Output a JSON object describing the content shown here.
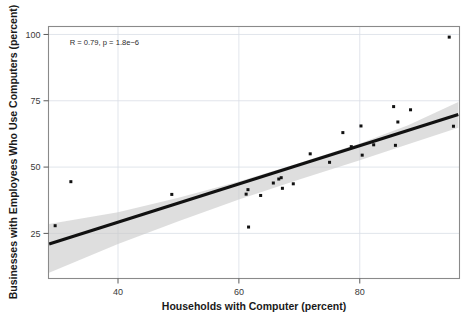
{
  "chart_data": {
    "type": "scatter",
    "title": "",
    "subtitle": "",
    "xlabel": "Households with Computer (percent)",
    "ylabel": "Businesses with Employees Who Use Computers (percent)",
    "xlim": [
      28.5,
      96.5
    ],
    "ylim": [
      8,
      103
    ],
    "xticks": [
      40,
      60,
      80
    ],
    "xtick_labels": [
      "40",
      "60",
      "80"
    ],
    "yticks": [
      25,
      50,
      75,
      100
    ],
    "ytick_labels": [
      "25",
      "50",
      "75",
      "100"
    ],
    "grid": true,
    "legend": "none",
    "annotations": [
      {
        "name": "correlation-annotation",
        "text": "R = 0.79, p = 1.8e−6",
        "x": 32,
        "y": 96
      }
    ],
    "series": [
      {
        "name": "states",
        "marker": "square",
        "color": "#111111",
        "points": [
          {
            "x": 29.6,
            "y": 27.9
          },
          {
            "x": 32.2,
            "y": 44.5
          },
          {
            "x": 48.9,
            "y": 39.7
          },
          {
            "x": 61.2,
            "y": 39.8
          },
          {
            "x": 61.5,
            "y": 41.5
          },
          {
            "x": 61.6,
            "y": 27.4
          },
          {
            "x": 63.6,
            "y": 39.3
          },
          {
            "x": 65.7,
            "y": 44.0
          },
          {
            "x": 66.6,
            "y": 45.5
          },
          {
            "x": 67.0,
            "y": 46.0
          },
          {
            "x": 67.2,
            "y": 42.0
          },
          {
            "x": 69.0,
            "y": 43.7
          },
          {
            "x": 71.8,
            "y": 55.0
          },
          {
            "x": 75.0,
            "y": 51.8
          },
          {
            "x": 77.2,
            "y": 63.0
          },
          {
            "x": 78.6,
            "y": 57.7
          },
          {
            "x": 80.2,
            "y": 65.5
          },
          {
            "x": 80.4,
            "y": 54.5
          },
          {
            "x": 82.3,
            "y": 58.4
          },
          {
            "x": 85.6,
            "y": 72.8
          },
          {
            "x": 85.9,
            "y": 58.2
          },
          {
            "x": 86.3,
            "y": 67.0
          },
          {
            "x": 88.4,
            "y": 71.6
          },
          {
            "x": 94.8,
            "y": 99.0
          },
          {
            "x": 95.5,
            "y": 65.4
          }
        ]
      }
    ],
    "fit_line": {
      "name": "linear-regression-fit",
      "color": "#111111",
      "x_start": 28.6,
      "y_start": 21.0,
      "x_end": 96.3,
      "y_end": 69.8
    },
    "confidence_band": {
      "name": "confidence-interval-ribbon",
      "color": "#c9c9c9",
      "upper": [
        {
          "x": 28.6,
          "y": 28.5
        },
        {
          "x": 40.0,
          "y": 33.0
        },
        {
          "x": 50.0,
          "y": 38.4
        },
        {
          "x": 60.0,
          "y": 44.6
        },
        {
          "x": 70.0,
          "y": 51.5
        },
        {
          "x": 80.0,
          "y": 58.9
        },
        {
          "x": 88.0,
          "y": 65.8
        },
        {
          "x": 96.3,
          "y": 74.5
        }
      ],
      "lower": [
        {
          "x": 96.3,
          "y": 64.8
        },
        {
          "x": 88.0,
          "y": 58.6
        },
        {
          "x": 80.0,
          "y": 52.6
        },
        {
          "x": 70.0,
          "y": 45.3
        },
        {
          "x": 60.0,
          "y": 37.8
        },
        {
          "x": 50.0,
          "y": 29.6
        },
        {
          "x": 40.0,
          "y": 21.0
        },
        {
          "x": 28.6,
          "y": 10.2
        }
      ]
    }
  },
  "colors": {
    "point": "#111111",
    "line": "#111111",
    "ribbon": "#c9c9c9",
    "grid": "#d9dee6",
    "frame": "#8a8a8a",
    "background": "#ffffff"
  }
}
